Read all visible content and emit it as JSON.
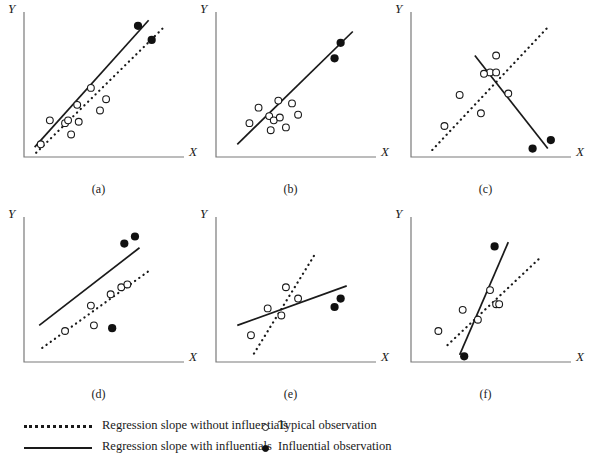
{
  "figure": {
    "panel_count": 6,
    "background_color": "#ffffff",
    "line_color": "#1a1a1a",
    "open_marker_color": "#ffffff",
    "filled_marker_color": "#111111"
  },
  "axes": {
    "x_label": "X",
    "y_label": "Y"
  },
  "legend": {
    "lines": [
      {
        "style": "dotted",
        "label": "Regression slope without influentials"
      },
      {
        "style": "solid",
        "label": "Regression slope with influentials"
      }
    ],
    "markers": [
      {
        "style": "open",
        "label": "Typical observation"
      },
      {
        "style": "filled",
        "label": "Influential observation"
      }
    ]
  },
  "chart_data": {
    "type": "scatter",
    "xlabel": "X",
    "ylabel": "Y",
    "xlim": [
      0,
      100
    ],
    "ylim": [
      0,
      100
    ],
    "grid": false,
    "legend_position": "bottom",
    "panels": [
      {
        "id": "a",
        "caption": "(a)",
        "description": "Influentials reinforce existing positive slope; both lines nearly parallel",
        "typical_points": [
          [
            11,
            9
          ],
          [
            17,
            26
          ],
          [
            27,
            24
          ],
          [
            29,
            26
          ],
          [
            31,
            16
          ],
          [
            35,
            37
          ],
          [
            44,
            49
          ],
          [
            50,
            33
          ],
          [
            54,
            41
          ],
          [
            36,
            25
          ]
        ],
        "influential_points": [
          [
            75,
            93
          ],
          [
            84,
            83
          ]
        ],
        "line_with_influentials": {
          "x0": 7,
          "y0": 7,
          "x1": 82,
          "y1": 97,
          "style": "solid"
        },
        "line_without_influentials": {
          "x0": 8,
          "y0": 3,
          "x1": 92,
          "y1": 92,
          "style": "dotted"
        }
      },
      {
        "id": "b",
        "caption": "(b)",
        "description": "Influentials lie on the existing regression line; slope unchanged, lines coincide",
        "typical_points": [
          [
            28,
            35
          ],
          [
            22,
            24
          ],
          [
            35,
            29
          ],
          [
            38,
            26
          ],
          [
            42,
            28
          ],
          [
            36,
            19
          ],
          [
            46,
            21
          ],
          [
            50,
            38
          ],
          [
            54,
            30
          ],
          [
            41,
            40
          ]
        ],
        "influential_points": [
          [
            78,
            70
          ],
          [
            82,
            81
          ]
        ],
        "line_with_influentials": {
          "x0": 14,
          "y0": 9,
          "x1": 90,
          "y1": 89,
          "style": "solid"
        },
        "line_without_influentials": {
          "x0": 14,
          "y0": 9,
          "x1": 90,
          "y1": 89,
          "style": "coincident"
        }
      },
      {
        "id": "c",
        "caption": "(c)",
        "description": "Influentials reverse the sign of the slope from positive to negative",
        "typical_points": [
          [
            22,
            22
          ],
          [
            32,
            44
          ],
          [
            46,
            31
          ],
          [
            52,
            60
          ],
          [
            56,
            60
          ],
          [
            56,
            72
          ],
          [
            64,
            45
          ],
          [
            48,
            59
          ]
        ],
        "influential_points": [
          [
            80,
            6
          ],
          [
            92,
            12
          ]
        ],
        "line_with_influentials": {
          "x0": 42,
          "y0": 72,
          "x1": 90,
          "y1": 6,
          "style": "solid"
        },
        "line_without_influentials": {
          "x0": 14,
          "y0": 5,
          "x1": 90,
          "y1": 92,
          "style": "dotted"
        }
      },
      {
        "id": "d",
        "caption": "(d)",
        "description": "Influentials shift the intercept upward and steepen the slope",
        "typical_points": [
          [
            27,
            22
          ],
          [
            44,
            40
          ],
          [
            46,
            26
          ],
          [
            57,
            48
          ],
          [
            64,
            53
          ],
          [
            68,
            55
          ]
        ],
        "influential_points": [
          [
            66,
            84
          ],
          [
            73,
            89
          ],
          [
            58,
            24
          ]
        ],
        "line_with_influentials": {
          "x0": 10,
          "y0": 26,
          "x1": 76,
          "y1": 81,
          "style": "solid"
        },
        "line_without_influentials": {
          "x0": 12,
          "y0": 10,
          "x1": 84,
          "y1": 66,
          "style": "dotted"
        }
      },
      {
        "id": "e",
        "caption": "(e)",
        "description": "Influentials flatten a steep positive slope",
        "typical_points": [
          [
            23,
            19
          ],
          [
            34,
            38
          ],
          [
            46,
            53
          ],
          [
            43,
            33
          ],
          [
            54,
            45
          ]
        ],
        "influential_points": [
          [
            82,
            45
          ],
          [
            78,
            39
          ]
        ],
        "line_with_influentials": {
          "x0": 14,
          "y0": 26,
          "x1": 86,
          "y1": 54,
          "style": "solid"
        },
        "line_without_influentials": {
          "x0": 25,
          "y0": 6,
          "x1": 66,
          "y1": 78,
          "style": "dotted"
        }
      },
      {
        "id": "f",
        "caption": "(f)",
        "description": "Influentials steepen a moderate positive slope",
        "typical_points": [
          [
            18,
            22
          ],
          [
            34,
            37
          ],
          [
            44,
            30
          ],
          [
            52,
            51
          ],
          [
            56,
            41
          ],
          [
            58,
            41
          ]
        ],
        "influential_points": [
          [
            55,
            82
          ],
          [
            35,
            4
          ]
        ],
        "line_with_influentials": {
          "x0": 32,
          "y0": 5,
          "x1": 64,
          "y1": 85,
          "style": "solid"
        },
        "line_without_influentials": {
          "x0": 24,
          "y0": 12,
          "x1": 86,
          "y1": 75,
          "style": "dotted"
        }
      }
    ]
  }
}
